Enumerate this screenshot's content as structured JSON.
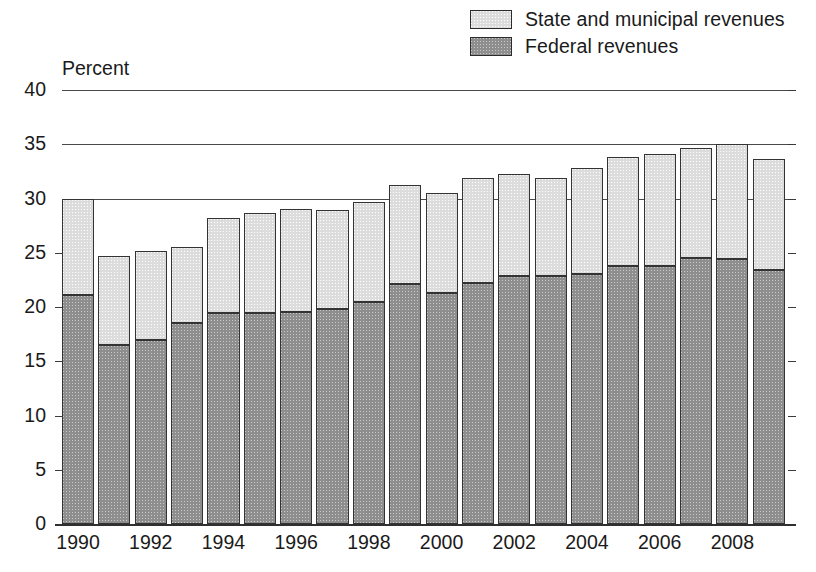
{
  "axis_title": "Percent",
  "legend": {
    "items": [
      {
        "label": "State and municipal revenues",
        "swatch": "state-swatch",
        "color": "#dcdcdc"
      },
      {
        "label": "Federal revenues",
        "swatch": "federal-swatch",
        "color": "#8e8e8e"
      }
    ]
  },
  "chart_data": {
    "type": "bar",
    "stacked": true,
    "title": "",
    "subtitle": "",
    "xlabel": "",
    "ylabel": "Percent",
    "ylim": [
      0,
      40
    ],
    "yticks": [
      0,
      5,
      10,
      15,
      20,
      25,
      30,
      35,
      40
    ],
    "ytick_labels": [
      "0",
      "5",
      "10",
      "15",
      "20",
      "25",
      "30",
      "35",
      "40"
    ],
    "grid": "horizontal-major-above-30",
    "gridlines_drawn_at": [
      30,
      35,
      40
    ],
    "legend_position": "top-right",
    "categories": [
      "1990",
      "1991",
      "1992",
      "1993",
      "1994",
      "1995",
      "1996",
      "1997",
      "1998",
      "1999",
      "2000",
      "2001",
      "2002",
      "2003",
      "2004",
      "2005",
      "2006",
      "2007",
      "2008",
      "2009"
    ],
    "xtick_labels_shown": [
      "1990",
      "1992",
      "1994",
      "1996",
      "1998",
      "2000",
      "2002",
      "2004",
      "2006",
      "2008"
    ],
    "series": [
      {
        "name": "Federal revenues",
        "color": "#8e8e8e",
        "values": [
          21.1,
          16.5,
          17.0,
          18.5,
          19.4,
          19.4,
          19.5,
          19.8,
          20.5,
          22.1,
          21.3,
          22.2,
          22.9,
          22.9,
          23.0,
          23.8,
          23.8,
          24.5,
          24.4,
          23.4
        ]
      },
      {
        "name": "State and municipal revenues",
        "color": "#dcdcdc",
        "values": [
          8.9,
          8.2,
          8.2,
          7.0,
          8.8,
          9.3,
          9.5,
          9.1,
          9.2,
          9.1,
          9.2,
          9.7,
          9.4,
          9.0,
          9.8,
          10.0,
          10.3,
          10.2,
          10.6,
          10.2
        ]
      }
    ],
    "totals": [
      30.0,
      24.7,
      25.2,
      25.5,
      28.2,
      28.7,
      29.0,
      28.9,
      29.7,
      31.2,
      30.5,
      31.9,
      32.3,
      31.9,
      32.8,
      33.8,
      34.1,
      34.7,
      35.0,
      33.6
    ]
  }
}
